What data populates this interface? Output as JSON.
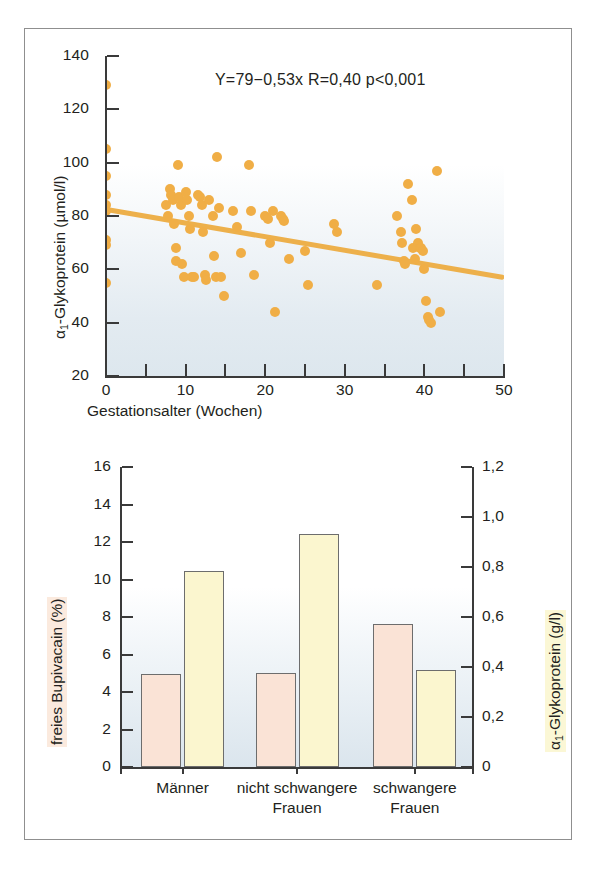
{
  "figure": {
    "panels": [
      "scatter",
      "bar"
    ]
  },
  "chart_data": [
    {
      "id": "scatter",
      "type": "scatter",
      "title": "",
      "annotation": "Y=79−0,53x  R=0,40  p<0,001",
      "xlabel": "Gestationsalter (Wochen)",
      "ylabel": "α₁-Glykoprotein (µmol/l)",
      "ylabel_main": "-Glykoprotein (µmol/l)",
      "ylabel_symbol": "α",
      "ylabel_sub": "1",
      "xlim": [
        0,
        50
      ],
      "ylim": [
        20,
        140
      ],
      "xticks": [
        0,
        10,
        20,
        30,
        40,
        50
      ],
      "xtick_labels": [
        "0",
        "10",
        "20",
        "30",
        "40",
        "50"
      ],
      "xminorticks": [
        5,
        15,
        25,
        35,
        45
      ],
      "yticks": [
        20,
        40,
        60,
        80,
        100,
        120,
        140
      ],
      "ytick_labels": [
        "20",
        "40",
        "60",
        "80",
        "100",
        "120",
        "140"
      ],
      "grid": false,
      "marker_color": "#f0ae46",
      "line_color": "#edb04b",
      "regression": {
        "intercept": 79,
        "slope": -0.53,
        "r": 0.4,
        "p": "<0,001",
        "line_x": [
          0,
          50
        ],
        "line_y": [
          82.5,
          57.0
        ]
      },
      "points": [
        [
          0,
          129
        ],
        [
          0,
          105
        ],
        [
          0,
          95
        ],
        [
          0,
          88
        ],
        [
          0,
          84
        ],
        [
          0,
          82
        ],
        [
          0,
          71
        ],
        [
          0,
          69
        ],
        [
          0,
          55
        ],
        [
          7.5,
          84
        ],
        [
          7.8,
          80
        ],
        [
          8,
          90
        ],
        [
          8.2,
          88
        ],
        [
          8.4,
          86
        ],
        [
          8.6,
          77
        ],
        [
          8.8,
          68
        ],
        [
          8.8,
          63
        ],
        [
          9,
          99
        ],
        [
          9.2,
          87
        ],
        [
          9.4,
          84
        ],
        [
          9.6,
          62
        ],
        [
          9.8,
          57
        ],
        [
          10,
          89
        ],
        [
          10.2,
          86
        ],
        [
          10.4,
          80
        ],
        [
          10.6,
          75
        ],
        [
          10.8,
          57
        ],
        [
          11,
          57
        ],
        [
          11.5,
          88
        ],
        [
          11.8,
          87
        ],
        [
          12,
          84
        ],
        [
          12.2,
          74
        ],
        [
          12.4,
          58
        ],
        [
          12.6,
          56
        ],
        [
          13,
          86
        ],
        [
          13.4,
          80
        ],
        [
          13.6,
          65
        ],
        [
          13.8,
          57
        ],
        [
          14,
          102
        ],
        [
          14.2,
          83
        ],
        [
          14.4,
          57
        ],
        [
          14.8,
          50
        ],
        [
          16,
          82
        ],
        [
          16.4,
          76
        ],
        [
          17,
          66
        ],
        [
          18,
          99
        ],
        [
          18.2,
          82
        ],
        [
          18.6,
          58
        ],
        [
          20,
          80
        ],
        [
          20.4,
          79
        ],
        [
          20.6,
          70
        ],
        [
          21,
          82
        ],
        [
          21.2,
          44
        ],
        [
          22,
          80
        ],
        [
          22.2,
          79
        ],
        [
          22.4,
          78
        ],
        [
          23,
          64
        ],
        [
          25,
          67
        ],
        [
          25.4,
          54
        ],
        [
          28.6,
          77
        ],
        [
          29,
          74
        ],
        [
          34,
          54
        ],
        [
          36.6,
          80
        ],
        [
          37,
          74
        ],
        [
          37.2,
          70
        ],
        [
          37.4,
          63
        ],
        [
          37.6,
          62
        ],
        [
          38,
          92
        ],
        [
          38.4,
          86
        ],
        [
          38.6,
          68
        ],
        [
          38.8,
          64
        ],
        [
          39,
          75
        ],
        [
          39.2,
          70
        ],
        [
          39.4,
          68
        ],
        [
          39.6,
          68
        ],
        [
          39.8,
          67
        ],
        [
          40,
          60
        ],
        [
          40.2,
          48
        ],
        [
          40.4,
          42
        ],
        [
          40.6,
          41
        ],
        [
          40.8,
          40
        ],
        [
          41.6,
          97
        ],
        [
          42,
          44
        ]
      ]
    },
    {
      "id": "bar",
      "type": "bar",
      "title": "",
      "categories": [
        "Männer",
        "nicht schwangere\nFrauen",
        "schwangere\nFrauen"
      ],
      "category_lines": [
        [
          "Männer",
          ""
        ],
        [
          "nicht schwangere",
          "Frauen"
        ],
        [
          "schwangere",
          "Frauen"
        ]
      ],
      "ylabel_left": "freies Bupivacain (%)",
      "ylabel_right": "α₁-Glykoprotein (g/l)",
      "ylabel_right_symbol": "α",
      "ylabel_right_sub": "1",
      "ylabel_right_main": "-Glykoprotein (g/l)",
      "ylim_left": [
        0,
        16
      ],
      "ylim_right": [
        0,
        1.2
      ],
      "yticks_left": [
        0,
        2,
        4,
        6,
        8,
        10,
        12,
        14,
        16
      ],
      "ytick_labels_left": [
        "0",
        "2",
        "4",
        "6",
        "8",
        "10",
        "12",
        "14",
        "16"
      ],
      "yticks_right": [
        0,
        0.2,
        0.4,
        0.6,
        0.8,
        1.0,
        1.2
      ],
      "ytick_labels_right": [
        "0",
        "0,2",
        "0,4",
        "0,6",
        "0,8",
        "1,0",
        "1,2"
      ],
      "grid": false,
      "series": [
        {
          "name": "freies Bupivacain (%)",
          "axis": "left",
          "color": "#fae3d6",
          "values": [
            4.95,
            5.0,
            7.65
          ]
        },
        {
          "name": "α₁-Glykoprotein (g/l)",
          "axis": "right",
          "color": "#fbf6cf",
          "values": [
            0.78,
            0.93,
            0.39
          ]
        }
      ],
      "series_right_as_left_scale": [
        10.45,
        12.45,
        5.2
      ]
    }
  ]
}
